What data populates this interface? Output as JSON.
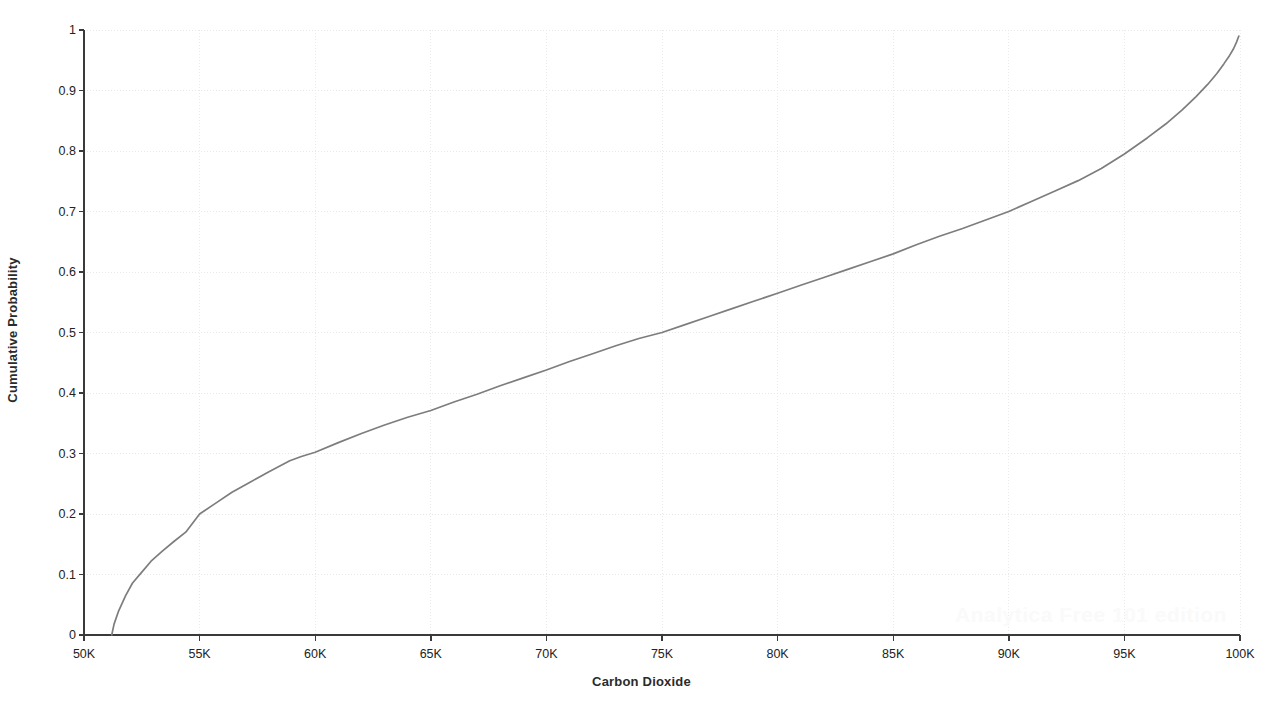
{
  "watermark": {
    "text": "Analytica Free 101 edition"
  },
  "chart_data": {
    "type": "line",
    "title": "",
    "subtitle": "",
    "xlabel": "Carbon Dioxide",
    "ylabel": "Cumulative Probability",
    "xlim": [
      50000,
      100000
    ],
    "ylim": [
      0,
      1
    ],
    "grid": true,
    "legend": null,
    "legend_position": "none",
    "line_color": "#7d7d7d",
    "axis_color": "#3a3a3a",
    "grid_color": "#e9e9e9",
    "xtick_labels": [
      "50K",
      "55K",
      "60K",
      "65K",
      "70K",
      "75K",
      "80K",
      "85K",
      "90K",
      "95K",
      "100K"
    ],
    "xtick_values": [
      50000,
      55000,
      60000,
      65000,
      70000,
      75000,
      80000,
      85000,
      90000,
      95000,
      100000
    ],
    "ytick_labels": [
      "0",
      "0.1",
      "0.2",
      "0.3",
      "0.4",
      "0.5",
      "0.6",
      "0.7",
      "0.8",
      "0.9",
      "1"
    ],
    "ytick_values": [
      0,
      0.1,
      0.2,
      0.3,
      0.4,
      0.5,
      0.6,
      0.7,
      0.8,
      0.9,
      1
    ],
    "series": [
      {
        "name": "Carbon Dioxide CDF",
        "x": [
          51200,
          51300,
          51500,
          51800,
          52100,
          52500,
          52900,
          53400,
          53900,
          54400,
          55000,
          55700,
          56400,
          57200,
          58000,
          58900,
          59400,
          60000,
          61000,
          62000,
          63000,
          64000,
          65000,
          66000,
          67000,
          68000,
          69000,
          70000,
          71000,
          72000,
          73000,
          74000,
          75000,
          76000,
          77000,
          78000,
          79000,
          80000,
          81000,
          82000,
          83000,
          84000,
          85000,
          86000,
          87000,
          88000,
          89000,
          90000,
          91000,
          92000,
          93000,
          94000,
          95000,
          96000,
          96800,
          97500,
          98100,
          98600,
          99000,
          99300,
          99550,
          99720,
          99850,
          99950
        ],
        "y": [
          0.0,
          0.018,
          0.04,
          0.065,
          0.086,
          0.104,
          0.122,
          0.139,
          0.155,
          0.17,
          0.2,
          0.218,
          0.236,
          0.253,
          0.27,
          0.288,
          0.295,
          0.302,
          0.318,
          0.333,
          0.347,
          0.36,
          0.371,
          0.385,
          0.398,
          0.412,
          0.425,
          0.438,
          0.452,
          0.465,
          0.478,
          0.49,
          0.5,
          0.513,
          0.526,
          0.539,
          0.552,
          0.565,
          0.578,
          0.591,
          0.604,
          0.617,
          0.63,
          0.645,
          0.659,
          0.672,
          0.686,
          0.7,
          0.717,
          0.734,
          0.751,
          0.771,
          0.795,
          0.822,
          0.845,
          0.868,
          0.89,
          0.91,
          0.928,
          0.944,
          0.958,
          0.969,
          0.98,
          0.99
        ]
      }
    ]
  }
}
